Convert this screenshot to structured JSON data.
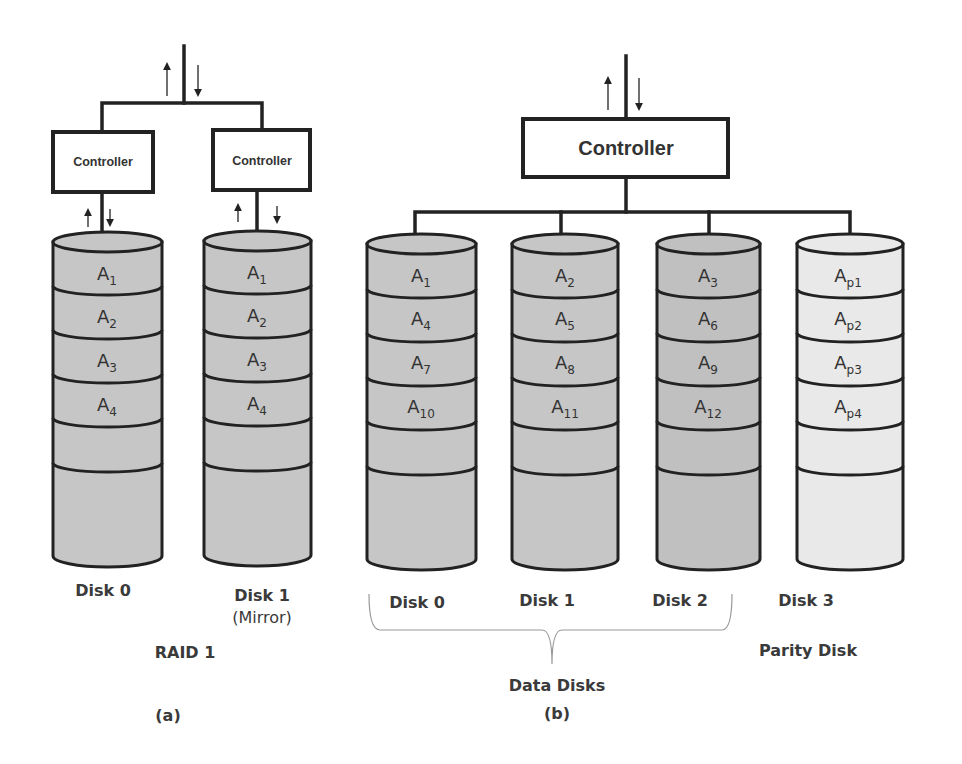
{
  "figure": {
    "panel_a": {
      "label": "(a)",
      "caption": "RAID 1",
      "controllers": [
        "Controller",
        "Controller"
      ],
      "disks": [
        {
          "name": "Disk 0",
          "note": "",
          "blocks": [
            {
              "base": "A",
              "sub": "1"
            },
            {
              "base": "A",
              "sub": "2"
            },
            {
              "base": "A",
              "sub": "3"
            },
            {
              "base": "A",
              "sub": "4"
            }
          ]
        },
        {
          "name": "Disk 1",
          "note": "(Mirror)",
          "blocks": [
            {
              "base": "A",
              "sub": "1"
            },
            {
              "base": "A",
              "sub": "2"
            },
            {
              "base": "A",
              "sub": "3"
            },
            {
              "base": "A",
              "sub": "4"
            }
          ]
        }
      ]
    },
    "panel_b": {
      "label": "(b)",
      "controller": "Controller",
      "data_group_label": "Data Disks",
      "parity_label": "Parity Disk",
      "disks": [
        {
          "name": "Disk 0",
          "blocks": [
            {
              "base": "A",
              "sub": "1"
            },
            {
              "base": "A",
              "sub": "4"
            },
            {
              "base": "A",
              "sub": "7"
            },
            {
              "base": "A",
              "sub": "10"
            }
          ]
        },
        {
          "name": "Disk 1",
          "blocks": [
            {
              "base": "A",
              "sub": "2"
            },
            {
              "base": "A",
              "sub": "5"
            },
            {
              "base": "A",
              "sub": "8"
            },
            {
              "base": "A",
              "sub": "11"
            }
          ]
        },
        {
          "name": "Disk 2",
          "blocks": [
            {
              "base": "A",
              "sub": "3"
            },
            {
              "base": "A",
              "sub": "6"
            },
            {
              "base": "A",
              "sub": "9"
            },
            {
              "base": "A",
              "sub": "12"
            }
          ]
        },
        {
          "name": "Disk 3",
          "blocks": [
            {
              "base": "A",
              "sub": "p1"
            },
            {
              "base": "A",
              "sub": "p2"
            },
            {
              "base": "A",
              "sub": "p3"
            },
            {
              "base": "A",
              "sub": "p4"
            }
          ]
        }
      ]
    },
    "colors": {
      "data_disk_fill": "#c6c6c6",
      "parity_disk_fill": "#e9e9e9",
      "line": "#222222",
      "text": "#333333"
    }
  }
}
